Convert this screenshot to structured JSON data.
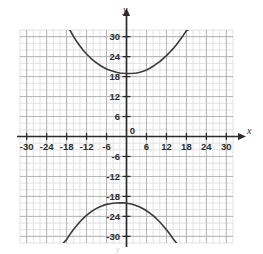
{
  "chart_data": {
    "type": "line",
    "title": "",
    "subtitle": "",
    "xlabel": "x",
    "ylabel": "y",
    "xlim": [
      -32,
      32
    ],
    "ylim": [
      -32,
      32
    ],
    "grid": true,
    "grid_minor_step": 2,
    "grid_major_step": 6,
    "legend": "none",
    "x_ticks": [
      -30,
      -24,
      -18,
      -12,
      -6,
      0,
      6,
      12,
      18,
      24,
      30
    ],
    "x_tick_labels": [
      "-30",
      "-24",
      "-18",
      "-12",
      "-6",
      "0",
      "6",
      "12",
      "18",
      "24",
      "30"
    ],
    "y_ticks": [
      30,
      24,
      18,
      12,
      6,
      0,
      -6,
      -12,
      -18,
      -24,
      -30
    ],
    "y_tick_labels": [
      "30",
      "24",
      "18",
      "12",
      "6",
      "0",
      "-6",
      "-12",
      "-18",
      "-24",
      "-30"
    ],
    "origin_label": "0",
    "x_axis_arrow": true,
    "y_axis_arrow": true,
    "bottom_faint_label": "y",
    "series": [
      {
        "name": "upper-branch",
        "comment": "Upper branch of hyperbola, vertex near (1, 19), opens upward",
        "vertex": [
          1,
          19
        ],
        "points": [
          [
            -17.0,
            32.0
          ],
          [
            -16.0,
            30.2
          ],
          [
            -15.0,
            28.6
          ],
          [
            -14.0,
            27.2
          ],
          [
            -13.0,
            25.9
          ],
          [
            -12.0,
            24.8
          ],
          [
            -11.0,
            23.8
          ],
          [
            -10.0,
            22.9
          ],
          [
            -9.0,
            22.1
          ],
          [
            -8.0,
            21.4
          ],
          [
            -7.0,
            20.8
          ],
          [
            -6.0,
            20.3
          ],
          [
            -5.0,
            19.9
          ],
          [
            -4.0,
            19.6
          ],
          [
            -3.0,
            19.3
          ],
          [
            -2.0,
            19.1
          ],
          [
            -1.0,
            19.0
          ],
          [
            0.0,
            18.95
          ],
          [
            1.0,
            18.95
          ],
          [
            2.0,
            19.0
          ],
          [
            3.0,
            19.1
          ],
          [
            4.0,
            19.3
          ],
          [
            5.0,
            19.6
          ],
          [
            6.0,
            20.0
          ],
          [
            7.0,
            20.5
          ],
          [
            8.0,
            21.1
          ],
          [
            9.0,
            21.8
          ],
          [
            10.0,
            22.5
          ],
          [
            11.0,
            23.4
          ],
          [
            12.0,
            24.3
          ],
          [
            13.0,
            25.3
          ],
          [
            14.0,
            26.4
          ],
          [
            15.0,
            27.6
          ],
          [
            16.0,
            28.9
          ],
          [
            17.0,
            30.3
          ],
          [
            18.0,
            31.8
          ],
          [
            18.5,
            32.0
          ]
        ]
      },
      {
        "name": "lower-branch",
        "comment": "Lower branch of hyperbola, vertex near (-1, -20), opens downward",
        "vertex": [
          -1,
          -20
        ],
        "points": [
          [
            -19.0,
            -32.0
          ],
          [
            -18.0,
            -31.0
          ],
          [
            -17.0,
            -29.4
          ],
          [
            -16.0,
            -28.0
          ],
          [
            -15.0,
            -26.8
          ],
          [
            -14.0,
            -25.6
          ],
          [
            -13.0,
            -24.6
          ],
          [
            -12.0,
            -23.7
          ],
          [
            -11.0,
            -22.9
          ],
          [
            -10.0,
            -22.2
          ],
          [
            -9.0,
            -21.6
          ],
          [
            -8.0,
            -21.1
          ],
          [
            -7.0,
            -20.7
          ],
          [
            -6.0,
            -20.4
          ],
          [
            -5.0,
            -20.2
          ],
          [
            -4.0,
            -20.05
          ],
          [
            -3.0,
            -19.97
          ],
          [
            -2.0,
            -19.95
          ],
          [
            -1.0,
            -19.95
          ],
          [
            0.0,
            -20.05
          ],
          [
            1.0,
            -20.2
          ],
          [
            2.0,
            -20.45
          ],
          [
            3.0,
            -20.8
          ],
          [
            4.0,
            -21.2
          ],
          [
            5.0,
            -21.7
          ],
          [
            6.0,
            -22.3
          ],
          [
            7.0,
            -23.0
          ],
          [
            8.0,
            -23.8
          ],
          [
            9.0,
            -24.7
          ],
          [
            10.0,
            -25.7
          ],
          [
            11.0,
            -26.8
          ],
          [
            12.0,
            -28.0
          ],
          [
            13.0,
            -29.3
          ],
          [
            14.0,
            -30.7
          ],
          [
            15.0,
            -32.0
          ]
        ]
      }
    ],
    "colors": {
      "curve": "#3a3a3a",
      "axis": "#2b2b2b",
      "grid_minor": "#e2e2e2",
      "grid_major": "#b5b5b5",
      "label": "#2b2b2b",
      "background": "#ffffff"
    }
  }
}
